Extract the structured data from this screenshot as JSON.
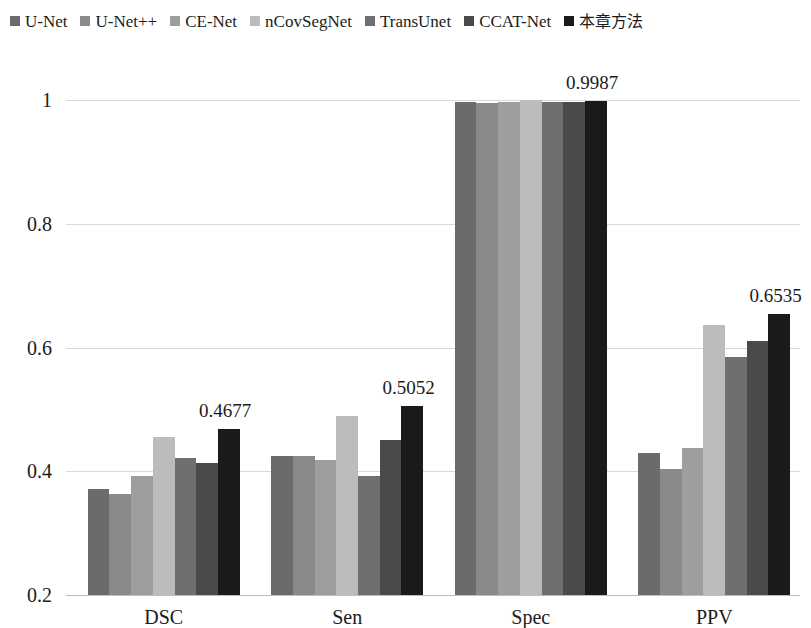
{
  "legend": {
    "items": [
      {
        "label": "U-Net",
        "color": "#6b6b6b",
        "cjk": false
      },
      {
        "label": "U-Net++",
        "color": "#8a8a8a",
        "cjk": false
      },
      {
        "label": "CE-Net",
        "color": "#9e9e9e",
        "cjk": false
      },
      {
        "label": "nCovSegNet",
        "color": "#bcbcbc",
        "cjk": false
      },
      {
        "label": "TransUnet",
        "color": "#6f6f6f",
        "cjk": false
      },
      {
        "label": "CCAT-Net",
        "color": "#4a4a4a",
        "cjk": false
      },
      {
        "label": "本章方法",
        "color": "#1a1a1a",
        "cjk": true
      }
    ]
  },
  "chart_data": {
    "type": "bar",
    "title": "",
    "subtitle": "",
    "xlabel": "",
    "ylabel": "",
    "categories": [
      "DSC",
      "Sen",
      "Spec",
      "PPV"
    ],
    "ylim": [
      0.2,
      1.0
    ],
    "yticks": [
      0.2,
      0.4,
      0.6,
      0.8,
      1
    ],
    "ytick_labels": [
      "0.2",
      "0.4",
      "0.6",
      "0.8",
      "1"
    ],
    "grid": true,
    "legend_position": "top",
    "series": [
      {
        "name": "U-Net",
        "color": "#6b6b6b",
        "values": [
          0.372,
          0.424,
          0.996,
          0.43
        ]
      },
      {
        "name": "U-Net++",
        "color": "#8a8a8a",
        "values": [
          0.363,
          0.424,
          0.9952,
          0.404
        ]
      },
      {
        "name": "CE-Net",
        "color": "#9e9e9e",
        "values": [
          0.392,
          0.418,
          0.9968,
          0.438
        ]
      },
      {
        "name": "nCovSegNet",
        "color": "#bcbcbc",
        "values": [
          0.456,
          0.49,
          1.0,
          0.637
        ]
      },
      {
        "name": "TransUnet",
        "color": "#6f6f6f",
        "values": [
          0.421,
          0.393,
          0.9962,
          0.584
        ]
      },
      {
        "name": "CCAT-Net",
        "color": "#4a4a4a",
        "values": [
          0.414,
          0.45,
          0.9972,
          0.611
        ]
      },
      {
        "name": "本章方法",
        "color": "#1a1a1a",
        "values": [
          0.4677,
          0.5052,
          0.9987,
          0.6535
        ]
      }
    ],
    "annotations": [
      {
        "category": "DSC",
        "text": "0.4677"
      },
      {
        "category": "Sen",
        "text": "0.5052"
      },
      {
        "category": "Spec",
        "text": "0.9987"
      },
      {
        "category": "PPV",
        "text": "0.6535"
      }
    ]
  }
}
